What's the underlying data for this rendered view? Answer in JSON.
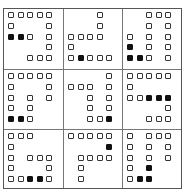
{
  "puzzle": {
    "rows": 3,
    "cols": 3,
    "legend": {
      "O": "outlined-square",
      "F": "filled-square",
      ".": "empty"
    },
    "cells": [
      {
        "id": "r0c0",
        "pattern": [
          "OOOOO",
          "O...O",
          "FFO.O",
          "....O",
          "..OOO"
        ]
      },
      {
        "id": "r0c1",
        "pattern": [
          "...O.",
          "...O.",
          "OOOO.",
          "O....",
          "OFOOO"
        ]
      },
      {
        "id": "r0c2",
        "pattern": [
          "..OOO",
          "..O.O",
          "O.O.O",
          "F.O.O",
          "FFO.O"
        ]
      },
      {
        "id": "r1c0",
        "pattern": [
          "OOOOO",
          "O...O",
          "O.O.O",
          "O.O..",
          "FFO.."
        ]
      },
      {
        "id": "r1c1",
        "pattern": [
          "....O",
          "OOO.O",
          "..O.O",
          "..O.O",
          "..OOF"
        ]
      },
      {
        "id": "r1c2",
        "pattern": [
          "OOOOO",
          "O....",
          "OOFFF",
          "....O",
          "..OOO"
        ]
      },
      {
        "id": "r2c0",
        "pattern": [
          "OOO..",
          "O....",
          "O.OOO",
          "O...O",
          "OOFFO"
        ]
      },
      {
        "id": "r2c1",
        "pattern": [
          "OOOOO",
          "....F",
          ".OOOO",
          ".O...",
          ".O..."
        ]
      },
      {
        "id": "r2c2",
        "pattern": [
          "O.OOO",
          "O.O.O",
          "O.O.O",
          "O.F..",
          "OFF.."
        ]
      }
    ]
  },
  "colors": {
    "outline": "#333333",
    "filled": "#111111",
    "grid_line": "#777777",
    "background": "#ffffff"
  }
}
